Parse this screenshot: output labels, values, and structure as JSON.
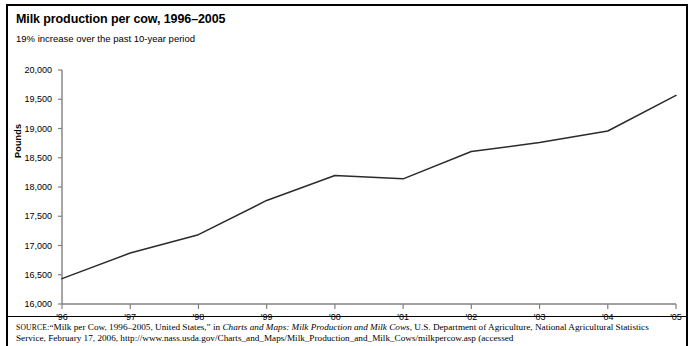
{
  "header": {
    "title": "Milk production per cow, 1996–2005",
    "subtitle": "19% increase over the past 10-year period"
  },
  "source": {
    "label": "SOURCE:",
    "text_part1": "“Milk per Cow, 1996–2005, United States,” in ",
    "italic1": "Charts and Maps: Milk Production and Milk Cows",
    "text_part2": ", U.S. Department of Agriculture, National Agricultural Statistics Service, February 17, 2006, http://www.nass.usda.gov/Charts_and_Maps/Milk_Production_and_Milk_Cows/milkpercow.asp (accessed"
  },
  "colors": {
    "line": "#2b2b2b",
    "axis": "#808080",
    "text": "#000000",
    "background": "#ffffff"
  },
  "chart_data": {
    "type": "line",
    "title": "Milk production per cow, 1996–2005",
    "subtitle": "19% increase over the past 10-year period",
    "xlabel": "",
    "ylabel": "Pounds",
    "categories": [
      "'96",
      "'97",
      "'98",
      "'99",
      "'00",
      "'01",
      "'02",
      "'03",
      "'04",
      "'05"
    ],
    "x_tick_labels": [
      "'96",
      "'97",
      "'98",
      "'99",
      "'00",
      "'01",
      "'02",
      "'03",
      "'04",
      "'05"
    ],
    "y_tick_labels": [
      "20,000",
      "19,500",
      "19,000",
      "18,500",
      "18,000",
      "17,500",
      "17,000",
      "16,500",
      "16,000"
    ],
    "y_tick_values": [
      20000,
      19500,
      19000,
      18500,
      18000,
      17500,
      17000,
      16500,
      16000
    ],
    "ylim": [
      16000,
      20000
    ],
    "grid": false,
    "legend": false,
    "series": [
      {
        "name": "Milk production per cow",
        "values": [
          16433,
          16871,
          17185,
          17770,
          18197,
          18139,
          18608,
          18760,
          18957,
          19565
        ]
      }
    ]
  }
}
